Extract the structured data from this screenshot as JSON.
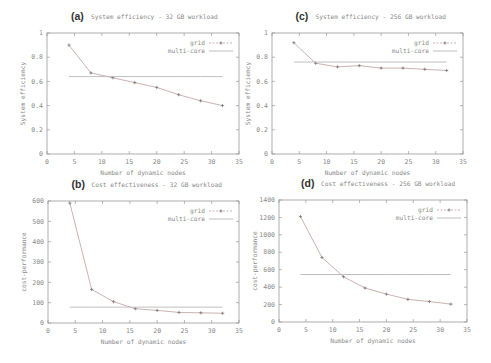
{
  "figure": {
    "style": {
      "axis_color": "#9a9a9a",
      "grid_line_color": "#c8a8a8",
      "multicore_color": "#b9b9b9",
      "text_color": "#8a8a8a"
    }
  },
  "chart_data": [
    {
      "id": "a",
      "type": "line",
      "letter": "(a)",
      "title": "System efficiency - 32 GB workload",
      "xlabel": "Number of dynamic nodes",
      "ylabel": "System efficiency",
      "xlim": [
        0,
        35
      ],
      "ylim": [
        0,
        1
      ],
      "xticks": [
        0,
        5,
        10,
        15,
        20,
        25,
        30,
        35
      ],
      "yticks": [
        0,
        0.2,
        0.4,
        0.6,
        0.8,
        1
      ],
      "ytick_labels": [
        "0",
        "0.2",
        "0.4",
        "0.6",
        "0.8",
        "1"
      ],
      "legend_position": "top-right",
      "grid": false,
      "x": [
        4,
        8,
        12,
        16,
        20,
        24,
        28,
        32
      ],
      "series": [
        {
          "name": "grid",
          "style": "line+points",
          "values": [
            0.9,
            0.67,
            0.63,
            0.59,
            0.55,
            0.49,
            0.44,
            0.4
          ]
        },
        {
          "name": "multi-core",
          "style": "line",
          "values": [
            0.64,
            0.64,
            0.64,
            0.64,
            0.64,
            0.64,
            0.64,
            0.64
          ]
        }
      ],
      "box": {
        "left": 47,
        "top": 33,
        "right": 239,
        "bottom": 154
      }
    },
    {
      "id": "c",
      "type": "line",
      "letter": "(c)",
      "title": "System efficiency - 256 GB workload",
      "xlabel": "Number of dynamic nodes",
      "ylabel": "System efficiency",
      "xlim": [
        0,
        35
      ],
      "ylim": [
        0,
        1
      ],
      "xticks": [
        0,
        5,
        10,
        15,
        20,
        25,
        30,
        35
      ],
      "yticks": [
        0,
        0.2,
        0.4,
        0.6,
        0.8,
        1
      ],
      "ytick_labels": [
        "0",
        "0.2",
        "0.4",
        "0.6",
        "0.8",
        "1"
      ],
      "legend_position": "top-right",
      "grid": false,
      "x": [
        4,
        8,
        12,
        16,
        20,
        24,
        28,
        32
      ],
      "series": [
        {
          "name": "grid",
          "style": "line+points",
          "values": [
            0.92,
            0.75,
            0.72,
            0.73,
            0.71,
            0.71,
            0.7,
            0.69
          ]
        },
        {
          "name": "multi-core",
          "style": "line",
          "values": [
            0.76,
            0.76,
            0.76,
            0.76,
            0.76,
            0.76,
            0.76,
            0.76
          ]
        }
      ],
      "box": {
        "left": 272,
        "top": 33,
        "right": 463,
        "bottom": 154
      }
    },
    {
      "id": "b",
      "type": "line",
      "letter": "(b)",
      "title": "Cost effectiveness - 32 GB workload",
      "xlabel": "Number of dynamic nodes",
      "ylabel": "cost-performance",
      "xlim": [
        0,
        35
      ],
      "ylim": [
        0,
        600
      ],
      "xticks": [
        0,
        5,
        10,
        15,
        20,
        25,
        30,
        35
      ],
      "yticks": [
        0,
        100,
        200,
        300,
        400,
        500,
        600
      ],
      "ytick_labels": [
        "0",
        "100",
        "200",
        "300",
        "400",
        "500",
        "600"
      ],
      "legend_position": "top-right",
      "grid": false,
      "x": [
        4,
        8,
        12,
        16,
        20,
        24,
        28,
        32
      ],
      "series": [
        {
          "name": "grid",
          "style": "line+points",
          "values": [
            590,
            165,
            105,
            70,
            62,
            52,
            50,
            48
          ]
        },
        {
          "name": "multi-core",
          "style": "line",
          "values": [
            78,
            78,
            78,
            78,
            78,
            78,
            78,
            78
          ]
        }
      ],
      "box": {
        "left": 48,
        "top": 201,
        "right": 239,
        "bottom": 323
      }
    },
    {
      "id": "d",
      "type": "line",
      "letter": "(d)",
      "title": "Cost effectiveness - 256 GB workload",
      "xlabel": "Number of dynamic nodes",
      "ylabel": "cost-performance",
      "xlim": [
        0,
        35
      ],
      "ylim": [
        0,
        1400
      ],
      "xticks": [
        0,
        5,
        10,
        15,
        20,
        25,
        30,
        35
      ],
      "yticks": [
        0,
        200,
        400,
        600,
        800,
        1000,
        1200,
        1400
      ],
      "ytick_labels": [
        "0",
        "200",
        "400",
        "600",
        "800",
        "1000",
        "1200",
        "1400"
      ],
      "legend_position": "top-right",
      "grid": false,
      "x": [
        4,
        8,
        12,
        16,
        20,
        24,
        28,
        32
      ],
      "series": [
        {
          "name": "grid",
          "style": "line+points",
          "values": [
            1210,
            740,
            520,
            390,
            320,
            260,
            235,
            205
          ]
        },
        {
          "name": "multi-core",
          "style": "line",
          "values": [
            545,
            545,
            545,
            545,
            545,
            545,
            545,
            545
          ]
        }
      ],
      "box": {
        "left": 279,
        "top": 200,
        "right": 467,
        "bottom": 322
      }
    }
  ]
}
